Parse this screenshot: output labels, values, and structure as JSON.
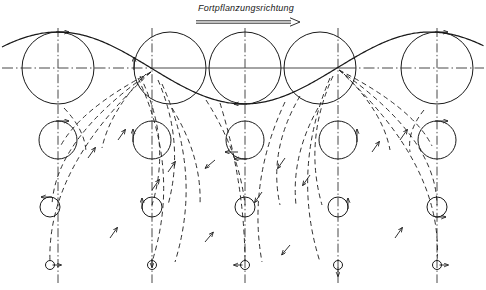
{
  "figure": {
    "caption": "Fortpflanzungsrichtung",
    "caption_x": 198,
    "caption_y": 4,
    "direction_arrow": {
      "x1": 196,
      "y1": 22,
      "x2": 300,
      "y2": 22,
      "name": "propagation-direction-arrow"
    },
    "stroke_color": "#1a1a1a",
    "background": "#ffffff",
    "width": 486,
    "height": 290
  },
  "chart_data": {
    "type": "line",
    "title": "Fortpflanzungsrichtung",
    "xlabel": "",
    "ylabel": "",
    "xlim": [
      0,
      486
    ],
    "ylim": [
      290,
      0
    ],
    "grid": false,
    "legend": null,
    "axis_line_y": 68,
    "wave": {
      "name": "surface-wave-profile",
      "amplitude": 36,
      "wavelength": 372,
      "crest_y": 32,
      "trough_y": 104,
      "mean_y": 68,
      "crest_x": [
        58,
        437
      ],
      "node_x": [
        152,
        338
      ],
      "trough_x": [
        245
      ]
    },
    "vertical_axes_x": [
      58,
      152,
      245,
      338,
      437
    ],
    "depth_rows": [
      {
        "row": 1,
        "y": 68,
        "radius": 36
      },
      {
        "row": 2,
        "y": 140,
        "radius": 19
      },
      {
        "row": 3,
        "y": 207,
        "radius": 10
      },
      {
        "row": 4,
        "y": 265,
        "radius": 4.5
      }
    ],
    "orbit_circles": [
      {
        "col": 0,
        "row": 1,
        "cx": 58,
        "cy": 68,
        "r": 36,
        "phase": "crest",
        "arrow": "right",
        "arrow_at": "top"
      },
      {
        "col": 1,
        "row": 1,
        "cx": 170,
        "cy": 68,
        "r": 36,
        "phase": "node-down",
        "arrow": "up",
        "arrow_at": "left"
      },
      {
        "col": 2,
        "row": 1,
        "cx": 245,
        "cy": 68,
        "r": 36,
        "phase": "trough",
        "arrow": "left",
        "arrow_at": "bottom"
      },
      {
        "col": 3,
        "row": 1,
        "cx": 320,
        "cy": 68,
        "r": 36,
        "phase": "node-up",
        "arrow": "none",
        "arrow_at": "none"
      },
      {
        "col": 4,
        "row": 1,
        "cx": 437,
        "cy": 68,
        "r": 36,
        "phase": "crest",
        "arrow": "right",
        "arrow_at": "top"
      },
      {
        "col": 0,
        "row": 2,
        "cx": 58,
        "cy": 140,
        "r": 19,
        "phase": "crest",
        "arrow": "right",
        "arrow_at": "top"
      },
      {
        "col": 1,
        "row": 2,
        "cx": 152,
        "cy": 140,
        "r": 19,
        "phase": "node",
        "arrow": "up",
        "arrow_at": "left"
      },
      {
        "col": 2,
        "row": 2,
        "cx": 245,
        "cy": 140,
        "r": 19,
        "phase": "trough",
        "arrow": "left",
        "arrow_at": "bottom"
      },
      {
        "col": 3,
        "row": 2,
        "cx": 338,
        "cy": 140,
        "r": 19,
        "phase": "node",
        "arrow": "up",
        "arrow_at": "right"
      },
      {
        "col": 4,
        "row": 2,
        "cx": 437,
        "cy": 140,
        "r": 19,
        "phase": "crest",
        "arrow": "right",
        "arrow_at": "top"
      },
      {
        "col": 0,
        "row": 3,
        "cx": 50,
        "cy": 207,
        "r": 10,
        "phase": "crest",
        "arrow": "left",
        "arrow_at": "top"
      },
      {
        "col": 1,
        "row": 3,
        "cx": 152,
        "cy": 207,
        "r": 10,
        "phase": "node",
        "arrow": "up",
        "arrow_at": "left"
      },
      {
        "col": 2,
        "row": 3,
        "cx": 245,
        "cy": 207,
        "r": 10,
        "phase": "trough",
        "arrow": "none",
        "arrow_at": "none"
      },
      {
        "col": 3,
        "row": 3,
        "cx": 338,
        "cy": 207,
        "r": 10,
        "phase": "node",
        "arrow": "up",
        "arrow_at": "right"
      },
      {
        "col": 4,
        "row": 3,
        "cx": 437,
        "cy": 207,
        "r": 10,
        "phase": "crest",
        "arrow": "right",
        "arrow_at": "bottom"
      },
      {
        "col": 0,
        "row": 4,
        "cx": 50,
        "cy": 265,
        "r": 4.5,
        "phase": "crest",
        "arrow": "right",
        "arrow_at": "right"
      },
      {
        "col": 1,
        "row": 4,
        "cx": 152,
        "cy": 265,
        "r": 4.5,
        "phase": "node",
        "arrow": "down",
        "arrow_at": "top"
      },
      {
        "col": 2,
        "row": 4,
        "cx": 245,
        "cy": 265,
        "r": 4.5,
        "phase": "trough",
        "arrow": "left",
        "arrow_at": "left"
      },
      {
        "col": 3,
        "row": 4,
        "cx": 338,
        "cy": 265,
        "r": 4.5,
        "phase": "node",
        "arrow": "down",
        "arrow_at": "bottom"
      },
      {
        "col": 4,
        "row": 4,
        "cx": 437,
        "cy": 265,
        "r": 4.5,
        "phase": "crest",
        "arrow": "right",
        "arrow_at": "right"
      }
    ],
    "streamlines_note": "Dashed curves fan downward from the wave nodes, each carrying a small direction arrow indicating orbital flow.",
    "stream_arrows": [
      {
        "x": 88,
        "y": 158,
        "angle": -55
      },
      {
        "x": 118,
        "y": 140,
        "angle": -55
      },
      {
        "x": 168,
        "y": 172,
        "angle": -55
      },
      {
        "x": 152,
        "y": 190,
        "angle": -55
      },
      {
        "x": 215,
        "y": 160,
        "angle": 140
      },
      {
        "x": 238,
        "y": 152,
        "angle": 180
      },
      {
        "x": 285,
        "y": 158,
        "angle": 125
      },
      {
        "x": 310,
        "y": 175,
        "angle": 125
      },
      {
        "x": 262,
        "y": 192,
        "angle": 125
      },
      {
        "x": 372,
        "y": 152,
        "angle": -55
      },
      {
        "x": 400,
        "y": 140,
        "angle": -55
      },
      {
        "x": 110,
        "y": 238,
        "angle": -55
      },
      {
        "x": 205,
        "y": 242,
        "angle": -50
      },
      {
        "x": 290,
        "y": 245,
        "angle": 130
      },
      {
        "x": 395,
        "y": 238,
        "angle": -55
      }
    ]
  }
}
